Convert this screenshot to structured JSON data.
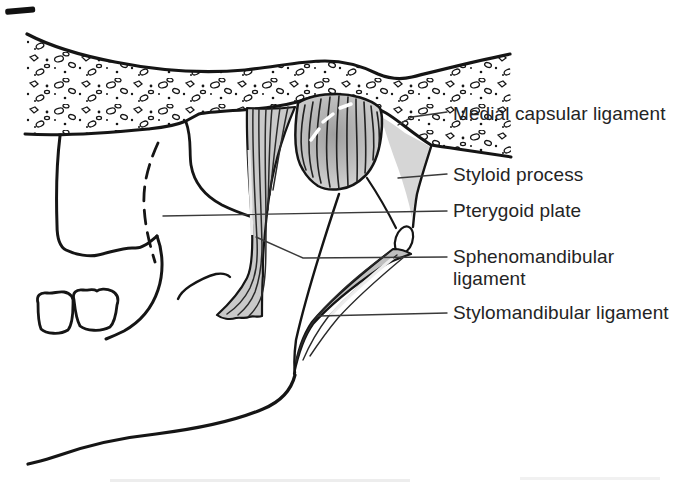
{
  "figure": {
    "kind": "anatomical-line-diagram",
    "background_color": "#ffffff",
    "ink_color": "#1a1a1a"
  },
  "labels": [
    {
      "id": "medial-capsular-ligament",
      "text": "Medial capsular ligament"
    },
    {
      "id": "styloid-process",
      "text": "Styloid process"
    },
    {
      "id": "pterygoid-plate",
      "text": "Pterygoid plate"
    },
    {
      "id": "sphenomandibular-ligament",
      "text": "Sphenomandibular ligament"
    },
    {
      "id": "stylomandibular-ligament",
      "text": "Stylomandibular ligament"
    }
  ],
  "colors": {
    "capsule_shading_center": "#a0a0a0",
    "capsule_shading_edge": "#d9d9d9",
    "sphenomandibular_band": "#c9c9c9",
    "styloid_wedge": "#d6d6d6",
    "stylomandibular_band": "#bfbfbf",
    "leader_line": "#3a3a3a",
    "text": "#242424"
  },
  "structures": [
    "skull-base-with-trabecular-bone",
    "pterygoid-plate-hidden-dashed-outline",
    "maxilla-with-molar-teeth",
    "tmj-capsule-dome",
    "sphenomandibular-ligament-band",
    "styloid-process",
    "stylomandibular-ligament-band",
    "mandible-ramus-and-lower-border"
  ]
}
